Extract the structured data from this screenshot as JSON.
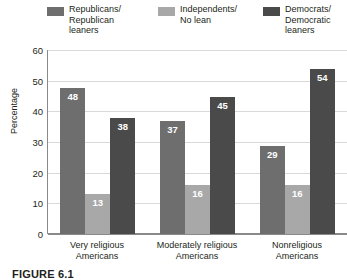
{
  "chart_data": {
    "type": "bar",
    "title": "",
    "xlabel": "",
    "ylabel": "Percentage",
    "ylim": [
      0,
      60
    ],
    "ytick_step": 10,
    "yticks": [
      60,
      50,
      40,
      30,
      20,
      10,
      0
    ],
    "grid": true,
    "legend_position": "top",
    "categories": [
      "Very religious\nAmericans",
      "Moderately religious\nAmericans",
      "Nonreligious\nAmericans"
    ],
    "series": [
      {
        "name": "Republicans/\nRepublican\nleaners",
        "color": "#6e6e6e",
        "values": [
          48,
          13,
          29
        ]
      },
      {
        "name": "Independents/\nNo lean",
        "color": "#a8a8a8",
        "values": [
          13,
          16,
          16
        ]
      },
      {
        "name": "Democrats/\nDemocratic\nleaners",
        "color": "#4a4a4a",
        "values": [
          38,
          45,
          54
        ]
      }
    ],
    "grouped_values": [
      [
        48,
        13,
        38
      ],
      [
        37,
        16,
        45
      ],
      [
        29,
        16,
        54
      ]
    ]
  },
  "legend": {
    "items": [
      {
        "label": "Republicans/\nRepublican\nleaners",
        "color": "#6e6e6e"
      },
      {
        "label": "Independents/\nNo lean",
        "color": "#a8a8a8"
      },
      {
        "label": "Democrats/\nDemocratic\nleaners",
        "color": "#4a4a4a"
      }
    ]
  },
  "axis": {
    "y_label": "Percentage",
    "y_ticks": [
      "60",
      "50",
      "40",
      "30",
      "20",
      "10",
      "0"
    ]
  },
  "x_categories": [
    "Very religious\nAmericans",
    "Moderately religious\nAmericans",
    "Nonreligious\nAmericans"
  ],
  "bar_labels": [
    [
      "48",
      "13",
      "38"
    ],
    [
      "37",
      "16",
      "45"
    ],
    [
      "29",
      "16",
      "54"
    ]
  ],
  "caption": {
    "figure_number": "FIGURE 6.1"
  },
  "colors": {
    "series_1": "#6e6e6e",
    "series_2": "#a8a8a8",
    "series_3": "#4a4a4a",
    "grid": "#d9d9d9",
    "axis": "#8a8a8a",
    "text": "#231f20",
    "value_label": "#ffffff"
  }
}
